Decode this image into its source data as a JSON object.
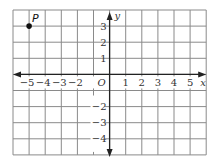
{
  "diagram": {
    "type": "coordinate-plane",
    "x_range": [
      -6,
      6
    ],
    "y_range": [
      -5,
      4
    ],
    "grid_step": 1,
    "axes": {
      "x_label": "x",
      "y_label": "y",
      "origin_label": "O"
    },
    "x_tick_labels": [
      {
        "value": -5,
        "text": "−5"
      },
      {
        "value": -4,
        "text": "−4"
      },
      {
        "value": -3,
        "text": "−3"
      },
      {
        "value": -2,
        "text": "−2"
      },
      {
        "value": 1,
        "text": "1"
      },
      {
        "value": 2,
        "text": "2"
      },
      {
        "value": 3,
        "text": "3"
      },
      {
        "value": 4,
        "text": "4"
      },
      {
        "value": 5,
        "text": "5"
      }
    ],
    "y_tick_labels": [
      {
        "value": 3,
        "text": "3"
      },
      {
        "value": 2,
        "text": "2"
      },
      {
        "value": 1,
        "text": "1"
      },
      {
        "value": -2,
        "text": "−2"
      },
      {
        "value": -3,
        "text": "−3"
      },
      {
        "value": -4,
        "text": "−4"
      }
    ],
    "points": [
      {
        "label": "P",
        "x": -5,
        "y": 3
      }
    ],
    "colors": {
      "grid": "#8a8a8a",
      "axis": "#222222",
      "point": "#111111"
    }
  }
}
